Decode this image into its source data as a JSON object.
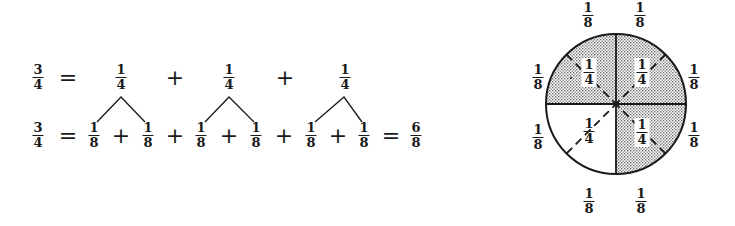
{
  "equation_row1": {
    "lhs": {
      "num": "3",
      "den": "4"
    },
    "equals": "=",
    "terms": [
      {
        "num": "1",
        "den": "4"
      },
      {
        "num": "1",
        "den": "4"
      },
      {
        "num": "1",
        "den": "4"
      }
    ],
    "operators": [
      "+",
      "+"
    ]
  },
  "equation_row2": {
    "lhs": {
      "num": "3",
      "den": "4"
    },
    "equals": "=",
    "terms": [
      {
        "num": "1",
        "den": "8"
      },
      {
        "num": "1",
        "den": "8"
      },
      {
        "num": "1",
        "den": "8"
      },
      {
        "num": "1",
        "den": "8"
      },
      {
        "num": "1",
        "den": "8"
      },
      {
        "num": "1",
        "den": "8"
      }
    ],
    "operators": [
      "+",
      "+",
      "+",
      "+",
      "+"
    ],
    "equals_result": "=",
    "result": {
      "num": "6",
      "den": "8"
    }
  },
  "circle": {
    "quarter_labels": [
      {
        "num": "1",
        "den": "4",
        "quadrant": "top-left",
        "shaded": true
      },
      {
        "num": "1",
        "den": "4",
        "quadrant": "top-right",
        "shaded": true
      },
      {
        "num": "1",
        "den": "4",
        "quadrant": "bottom-left",
        "shaded": false
      },
      {
        "num": "1",
        "den": "4",
        "quadrant": "bottom-right",
        "shaded": true
      }
    ],
    "eighth_labels": [
      {
        "num": "1",
        "den": "8",
        "position": "top-left"
      },
      {
        "num": "1",
        "den": "8",
        "position": "top-right"
      },
      {
        "num": "1",
        "den": "8",
        "position": "right-upper"
      },
      {
        "num": "1",
        "den": "8",
        "position": "right-lower"
      },
      {
        "num": "1",
        "den": "8",
        "position": "bottom-right"
      },
      {
        "num": "1",
        "den": "8",
        "position": "bottom-left"
      },
      {
        "num": "1",
        "den": "8",
        "position": "left-lower"
      },
      {
        "num": "1",
        "den": "8",
        "position": "left-upper"
      }
    ],
    "shaded_fraction": "3/4",
    "colors": {
      "stroke": "#1a1a1a",
      "shade_dot": "#6e6e6e",
      "background": "#ffffff"
    }
  }
}
